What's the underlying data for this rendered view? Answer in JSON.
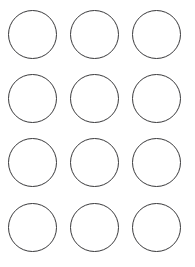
{
  "page": {
    "background_color": "#ffffff",
    "width": 195,
    "height": 267
  },
  "grid": {
    "columns": 3,
    "rows": 4,
    "total_shapes": 12,
    "shape_type": "circle-outline",
    "diameter": 49,
    "stroke_width": 1,
    "stroke_color": "#3a3a3c",
    "fill_color": "#ffffff",
    "margin_left": 8,
    "margin_top": 10,
    "column_pitch": 62,
    "row_pitch": 64,
    "shapes": [
      {
        "id": "circle-1",
        "row": 1,
        "column": 1,
        "x": 8,
        "y": 10,
        "label": ""
      },
      {
        "id": "circle-2",
        "row": 1,
        "column": 2,
        "x": 70,
        "y": 10,
        "label": ""
      },
      {
        "id": "circle-3",
        "row": 1,
        "column": 3,
        "x": 132,
        "y": 10,
        "label": ""
      },
      {
        "id": "circle-4",
        "row": 2,
        "column": 1,
        "x": 8,
        "y": 74,
        "label": ""
      },
      {
        "id": "circle-5",
        "row": 2,
        "column": 2,
        "x": 70,
        "y": 74,
        "label": ""
      },
      {
        "id": "circle-6",
        "row": 2,
        "column": 3,
        "x": 132,
        "y": 74,
        "label": ""
      },
      {
        "id": "circle-7",
        "row": 3,
        "column": 1,
        "x": 8,
        "y": 138,
        "label": ""
      },
      {
        "id": "circle-8",
        "row": 3,
        "column": 2,
        "x": 70,
        "y": 138,
        "label": ""
      },
      {
        "id": "circle-9",
        "row": 3,
        "column": 3,
        "x": 132,
        "y": 138,
        "label": ""
      },
      {
        "id": "circle-10",
        "row": 4,
        "column": 1,
        "x": 8,
        "y": 203,
        "label": ""
      },
      {
        "id": "circle-11",
        "row": 4,
        "column": 2,
        "x": 70,
        "y": 203,
        "label": ""
      },
      {
        "id": "circle-12",
        "row": 4,
        "column": 3,
        "x": 132,
        "y": 203,
        "label": ""
      }
    ]
  }
}
